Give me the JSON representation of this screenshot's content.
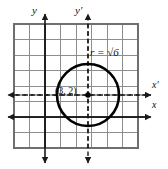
{
  "figure": {
    "kind": "coordinate-grid-with-circle",
    "background_color": "#ffffff",
    "grid": {
      "columns": 8,
      "rows": 8,
      "cell_size_px": 15.5,
      "left_px": 14,
      "top_px": 24,
      "line_color": "#8d8d8d",
      "border_color": "#6f6f6f"
    },
    "axes": {
      "original": {
        "style": "solid",
        "color": "#1a1a1a",
        "x_label": "x",
        "y_label": "y",
        "x_axis_y_px": 117,
        "y_axis_x_px": 45
      },
      "translated": {
        "style": "dashed",
        "color": "#1a1a1a",
        "x_label": "x'",
        "y_label": "y'",
        "x_axis_y_px": 95,
        "y_axis_x_px": 88
      }
    },
    "circle": {
      "center_label": "(3, 2)",
      "center_x_px": 88,
      "center_y_px": 95,
      "radius_px": 31,
      "stroke_color": "#000000",
      "stroke_width_px": 2.6,
      "radius_label_prefix": "r",
      "radius_label_equals": "=",
      "radius_label_value": "√6",
      "radius_label_full": "r = √6"
    },
    "center_dot": {
      "color": "#000000",
      "radius_px": 2.8
    }
  }
}
